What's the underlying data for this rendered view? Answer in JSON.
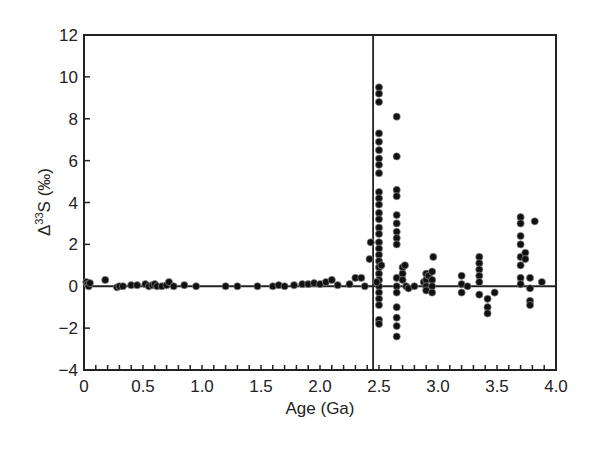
{
  "chart_data": {
    "type": "scatter",
    "title": "",
    "xlabel": "Age (Ga)",
    "ylabel_main": "Δ",
    "ylabel_sup": "33",
    "ylabel_rest": "S (‰)",
    "xlim": [
      0,
      4.0
    ],
    "ylim": [
      -4,
      12
    ],
    "x_ticks": [
      0,
      0.5,
      1.0,
      1.5,
      2.0,
      2.5,
      3.0,
      3.5,
      4.0
    ],
    "x_tick_labels": [
      "0",
      "0.5",
      "1.0",
      "1.5",
      "2.0",
      "2.5",
      "3.0",
      "3.5",
      "4.0"
    ],
    "y_ticks": [
      12,
      10,
      8,
      6,
      4,
      2,
      0,
      -2,
      -4
    ],
    "y_tick_labels": [
      "12",
      "10",
      "8",
      "6",
      "4",
      "2",
      "0",
      "−2",
      "−4"
    ],
    "reference_lines": {
      "horizontal_y": 0,
      "vertical_x": 2.45
    },
    "grid": false,
    "legend": null,
    "series": [
      {
        "name": "Δ33S measurements",
        "points": [
          [
            0.02,
            0.2
          ],
          [
            0.03,
            0.1
          ],
          [
            0.04,
            0.0
          ],
          [
            0.05,
            0.15
          ],
          [
            0.18,
            0.3
          ],
          [
            0.28,
            -0.05
          ],
          [
            0.3,
            0.0
          ],
          [
            0.33,
            0.0
          ],
          [
            0.4,
            0.05
          ],
          [
            0.45,
            0.05
          ],
          [
            0.52,
            0.1
          ],
          [
            0.55,
            0.0
          ],
          [
            0.58,
            0.05
          ],
          [
            0.6,
            0.1
          ],
          [
            0.62,
            0.0
          ],
          [
            0.66,
            0.0
          ],
          [
            0.7,
            0.05
          ],
          [
            0.72,
            0.2
          ],
          [
            0.76,
            0.0
          ],
          [
            0.85,
            0.05
          ],
          [
            0.95,
            0.0
          ],
          [
            1.2,
            0.0
          ],
          [
            1.3,
            0.0
          ],
          [
            1.47,
            0.0
          ],
          [
            1.6,
            0.0
          ],
          [
            1.65,
            0.05
          ],
          [
            1.7,
            0.0
          ],
          [
            1.78,
            0.05
          ],
          [
            1.85,
            0.1
          ],
          [
            1.9,
            0.1
          ],
          [
            1.95,
            0.15
          ],
          [
            2.0,
            0.1
          ],
          [
            2.05,
            0.2
          ],
          [
            2.1,
            0.3
          ],
          [
            2.15,
            0.05
          ],
          [
            2.25,
            0.1
          ],
          [
            2.3,
            0.4
          ],
          [
            2.35,
            0.4
          ],
          [
            2.38,
            0.0
          ],
          [
            2.42,
            1.3
          ],
          [
            2.43,
            2.1
          ],
          [
            2.5,
            9.5
          ],
          [
            2.5,
            9.2
          ],
          [
            2.5,
            8.8
          ],
          [
            2.5,
            7.3
          ],
          [
            2.5,
            6.9
          ],
          [
            2.5,
            6.5
          ],
          [
            2.5,
            6.1
          ],
          [
            2.5,
            5.8
          ],
          [
            2.5,
            5.4
          ],
          [
            2.5,
            4.5
          ],
          [
            2.5,
            4.2
          ],
          [
            2.5,
            3.9
          ],
          [
            2.5,
            3.5
          ],
          [
            2.5,
            3.2
          ],
          [
            2.5,
            2.8
          ],
          [
            2.5,
            2.5
          ],
          [
            2.5,
            2.1
          ],
          [
            2.5,
            1.8
          ],
          [
            2.5,
            1.5
          ],
          [
            2.5,
            1.2
          ],
          [
            2.5,
            0.9
          ],
          [
            2.5,
            0.6
          ],
          [
            2.5,
            0.3
          ],
          [
            2.5,
            0.0
          ],
          [
            2.5,
            -0.3
          ],
          [
            2.5,
            -0.6
          ],
          [
            2.5,
            -0.9
          ],
          [
            2.5,
            -1.6
          ],
          [
            2.5,
            -1.8
          ],
          [
            2.48,
            0.2
          ],
          [
            2.52,
            1.0
          ],
          [
            2.65,
            8.1
          ],
          [
            2.65,
            6.2
          ],
          [
            2.65,
            4.6
          ],
          [
            2.65,
            4.3
          ],
          [
            2.65,
            3.4
          ],
          [
            2.65,
            3.0
          ],
          [
            2.65,
            2.6
          ],
          [
            2.65,
            2.3
          ],
          [
            2.65,
            2.0
          ],
          [
            2.65,
            0.4
          ],
          [
            2.65,
            0.0
          ],
          [
            2.65,
            -0.3
          ],
          [
            2.65,
            -1.0
          ],
          [
            2.65,
            -1.5
          ],
          [
            2.65,
            -1.9
          ],
          [
            2.65,
            -2.4
          ],
          [
            2.7,
            0.9
          ],
          [
            2.7,
            0.6
          ],
          [
            2.7,
            0.3
          ],
          [
            2.72,
            1.0
          ],
          [
            2.73,
            0.0
          ],
          [
            2.75,
            -0.1
          ],
          [
            2.8,
            0.0
          ],
          [
            2.88,
            0.2
          ],
          [
            2.9,
            0.6
          ],
          [
            2.9,
            0.3
          ],
          [
            2.9,
            0.0
          ],
          [
            2.9,
            -0.2
          ],
          [
            2.92,
            0.5
          ],
          [
            2.95,
            0.7
          ],
          [
            2.95,
            0.3
          ],
          [
            2.95,
            0.0
          ],
          [
            2.95,
            -0.3
          ],
          [
            2.96,
            1.4
          ],
          [
            3.2,
            0.5
          ],
          [
            3.2,
            0.1
          ],
          [
            3.2,
            -0.3
          ],
          [
            3.25,
            0.0
          ],
          [
            3.35,
            1.4
          ],
          [
            3.35,
            1.1
          ],
          [
            3.35,
            0.8
          ],
          [
            3.35,
            0.5
          ],
          [
            3.35,
            0.2
          ],
          [
            3.35,
            -0.4
          ],
          [
            3.42,
            -0.6
          ],
          [
            3.42,
            -1.0
          ],
          [
            3.42,
            -1.3
          ],
          [
            3.48,
            -0.3
          ],
          [
            3.7,
            3.3
          ],
          [
            3.7,
            3.0
          ],
          [
            3.7,
            2.4
          ],
          [
            3.7,
            2.0
          ],
          [
            3.7,
            1.4
          ],
          [
            3.7,
            1.0
          ],
          [
            3.7,
            0.4
          ],
          [
            3.7,
            0.1
          ],
          [
            3.74,
            1.6
          ],
          [
            3.74,
            1.3
          ],
          [
            3.78,
            0.4
          ],
          [
            3.78,
            -0.1
          ],
          [
            3.78,
            -0.7
          ],
          [
            3.78,
            -0.9
          ],
          [
            3.82,
            3.1
          ],
          [
            3.88,
            0.2
          ]
        ]
      }
    ]
  }
}
